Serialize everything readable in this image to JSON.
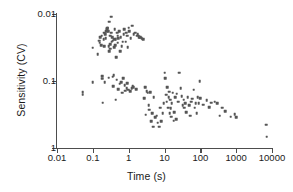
{
  "chart": {
    "type": "scatter",
    "title": "",
    "xlabel": "Time (s)",
    "ylabel": "Sensitivity (CV)",
    "xscale": "log",
    "yscale": "log",
    "y_inverted": true,
    "xlim": [
      0.01,
      10000
    ],
    "ylim_top": 0.01,
    "ylim_bottom": 1,
    "grid": false,
    "legend": null,
    "marker_color": "#555555",
    "axis_color": "#4d4d4d",
    "xticks": [
      "0.01",
      "0.1",
      "1",
      "10",
      "100",
      "1000",
      "10000"
    ],
    "yticks": [
      "0.01",
      "0.1",
      "1"
    ]
  },
  "chart_data": {
    "type": "scatter",
    "title": "",
    "xlabel": "Time (s)",
    "ylabel": "Sensitivity (CV)",
    "xscale": "log",
    "yscale": "log",
    "y_inverted": true,
    "xlim": [
      0.01,
      10000
    ],
    "ylim": [
      0.01,
      1
    ],
    "grid": false,
    "legend_position": "none",
    "series": [
      {
        "name": "contrast sensitivity",
        "marker": "square",
        "color": "#555555",
        "points": [
          [
            0.052,
            0.148
          ],
          [
            0.052,
            0.16
          ],
          [
            0.1,
            0.032
          ],
          [
            0.1,
            0.104
          ],
          [
            0.135,
            0.04
          ],
          [
            0.15,
            0.025
          ],
          [
            0.155,
            0.027
          ],
          [
            0.16,
            0.022
          ],
          [
            0.168,
            0.029
          ],
          [
            0.175,
            0.021
          ],
          [
            0.18,
            0.093
          ],
          [
            0.185,
            0.085
          ],
          [
            0.19,
            0.21
          ],
          [
            0.2,
            0.024
          ],
          [
            0.205,
            0.03
          ],
          [
            0.21,
            0.019
          ],
          [
            0.215,
            0.105
          ],
          [
            0.22,
            0.02
          ],
          [
            0.23,
            0.023
          ],
          [
            0.24,
            0.018
          ],
          [
            0.245,
            0.017
          ],
          [
            0.25,
            0.017
          ],
          [
            0.255,
            0.016
          ],
          [
            0.262,
            0.016
          ],
          [
            0.27,
            0.018
          ],
          [
            0.275,
            0.089
          ],
          [
            0.28,
            0.03
          ],
          [
            0.285,
            0.036
          ],
          [
            0.29,
            0.013
          ],
          [
            0.3,
            0.033
          ],
          [
            0.305,
            0.021
          ],
          [
            0.31,
            0.028
          ],
          [
            0.32,
            0.011
          ],
          [
            0.33,
            0.019
          ],
          [
            0.34,
            0.026
          ],
          [
            0.35,
            0.022
          ],
          [
            0.355,
            0.086
          ],
          [
            0.36,
            0.025
          ],
          [
            0.37,
            0.12
          ],
          [
            0.38,
            0.082
          ],
          [
            0.39,
            0.031
          ],
          [
            0.4,
            0.024
          ],
          [
            0.41,
            0.017
          ],
          [
            0.42,
            0.029
          ],
          [
            0.43,
            0.19
          ],
          [
            0.44,
            0.024
          ],
          [
            0.45,
            0.044
          ],
          [
            0.46,
            0.096
          ],
          [
            0.47,
            0.019
          ],
          [
            0.49,
            0.021
          ],
          [
            0.5,
            0.027
          ],
          [
            0.51,
            0.132
          ],
          [
            0.52,
            0.023
          ],
          [
            0.54,
            0.018
          ],
          [
            0.56,
            0.11
          ],
          [
            0.58,
            0.036
          ],
          [
            0.6,
            0.022
          ],
          [
            0.62,
            0.105
          ],
          [
            0.64,
            0.03
          ],
          [
            0.66,
            0.15
          ],
          [
            0.68,
            0.026
          ],
          [
            0.7,
            0.091
          ],
          [
            0.72,
            0.02
          ],
          [
            0.75,
            0.017
          ],
          [
            0.78,
            0.115
          ],
          [
            0.8,
            0.14
          ],
          [
            0.82,
            0.026
          ],
          [
            0.85,
            0.019
          ],
          [
            0.88,
            0.129
          ],
          [
            0.9,
            0.021
          ],
          [
            0.92,
            0.108
          ],
          [
            0.95,
            0.031
          ],
          [
            0.98,
            0.135
          ],
          [
            1.0,
            0.016
          ],
          [
            1.05,
            0.018
          ],
          [
            1.1,
            0.142
          ],
          [
            1.15,
            0.023
          ],
          [
            1.2,
            0.128
          ],
          [
            1.25,
            0.015
          ],
          [
            1.3,
            0.118
          ],
          [
            1.35,
            0.124
          ],
          [
            1.4,
            0.02
          ],
          [
            1.5,
            0.019
          ],
          [
            1.6,
            0.133
          ],
          [
            1.7,
            0.021
          ],
          [
            1.8,
            0.02
          ],
          [
            1.9,
            0.021
          ],
          [
            2.0,
            0.022
          ],
          [
            2.1,
            0.022
          ],
          [
            2.3,
            0.023
          ],
          [
            2.5,
            0.024
          ],
          [
            2.7,
            0.18
          ],
          [
            2.9,
            0.125
          ],
          [
            3.0,
            0.32
          ],
          [
            3.2,
            0.143
          ],
          [
            3.4,
            0.15
          ],
          [
            3.6,
            0.23
          ],
          [
            3.8,
            0.27
          ],
          [
            4.0,
            0.148
          ],
          [
            4.2,
            0.4
          ],
          [
            4.5,
            0.3
          ],
          [
            4.8,
            0.48
          ],
          [
            5.0,
            0.175
          ],
          [
            5.5,
            0.35
          ],
          [
            6.0,
            0.33
          ],
          [
            6.5,
            0.42
          ],
          [
            7.0,
            0.48
          ],
          [
            7.5,
            0.25
          ],
          [
            8.0,
            0.4
          ],
          [
            9.0,
            0.3
          ],
          [
            9.5,
            0.215
          ],
          [
            10.0,
            0.075
          ],
          [
            10.5,
            0.09
          ],
          [
            11.0,
            0.16
          ],
          [
            11.5,
            0.205
          ],
          [
            12.0,
            0.125
          ],
          [
            12.5,
            0.25
          ],
          [
            13.0,
            0.175
          ],
          [
            13.5,
            0.145
          ],
          [
            14.0,
            0.3
          ],
          [
            14.5,
            0.19
          ],
          [
            15.0,
            0.255
          ],
          [
            15.5,
            0.34
          ],
          [
            16.0,
            0.215
          ],
          [
            17.0,
            0.15
          ],
          [
            18.0,
            0.39
          ],
          [
            19.0,
            0.295
          ],
          [
            20.0,
            0.175
          ],
          [
            21.0,
            0.37
          ],
          [
            22.0,
            0.155
          ],
          [
            24.0,
            0.205
          ],
          [
            26.0,
            0.075
          ],
          [
            28.0,
            0.128
          ],
          [
            30.0,
            0.17
          ],
          [
            32.0,
            0.23
          ],
          [
            34.0,
            0.19
          ],
          [
            36.0,
            0.25
          ],
          [
            38.0,
            0.215
          ],
          [
            40.0,
            0.29
          ],
          [
            44.0,
            0.175
          ],
          [
            48.0,
            0.23
          ],
          [
            52.0,
            0.33
          ],
          [
            56.0,
            0.205
          ],
          [
            60.0,
            0.185
          ],
          [
            65.0,
            0.135
          ],
          [
            70.0,
            0.25
          ],
          [
            75.0,
            0.215
          ],
          [
            80.0,
            0.3
          ],
          [
            85.0,
            0.175
          ],
          [
            90.0,
            0.215
          ],
          [
            95.0,
            0.1
          ],
          [
            100.0,
            0.18
          ],
          [
            120.0,
            0.225
          ],
          [
            150.0,
            0.195
          ],
          [
            180.0,
            0.245
          ],
          [
            200.0,
            0.21
          ],
          [
            250.0,
            0.205
          ],
          [
            300.0,
            0.215
          ],
          [
            350.0,
            0.33
          ],
          [
            400.0,
            0.25
          ],
          [
            500.0,
            0.28
          ],
          [
            700.0,
            0.34
          ],
          [
            900.0,
            0.31
          ],
          [
            1000.0,
            0.35
          ],
          [
            7000.0,
            0.45
          ],
          [
            7200.0,
            0.68
          ]
        ]
      }
    ]
  }
}
